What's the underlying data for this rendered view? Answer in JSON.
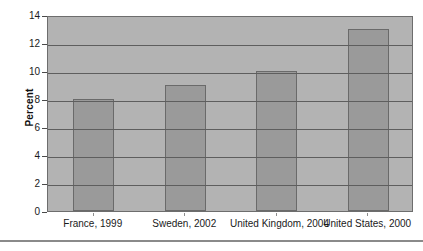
{
  "chart_data": {
    "type": "bar",
    "title": "",
    "xlabel": "",
    "ylabel": "Percent",
    "ylim": [
      0,
      14
    ],
    "ytick_step": 2,
    "grid": true,
    "legend": "none",
    "categories": [
      "France, 1999",
      "Sweden, 2002",
      "United Kingdom, 2004",
      "United States, 2000"
    ],
    "values": [
      8,
      9,
      10,
      13
    ],
    "yticks": [
      "0",
      "2",
      "4",
      "6",
      "8",
      "10",
      "12",
      "14"
    ],
    "ytick_values": [
      0,
      2,
      4,
      6,
      8,
      10,
      12,
      14
    ],
    "colors": {
      "bar_fill": "#9a9a9a",
      "bar_border": "#6a6a6a",
      "plot_background": "#b3b3b3",
      "gridline": "#5e5e5e",
      "plot_border": "#6d6d6d",
      "text": "#1a1a1a",
      "page_background": "#ffffff",
      "bottom_rule": "#8a8a8a"
    }
  }
}
